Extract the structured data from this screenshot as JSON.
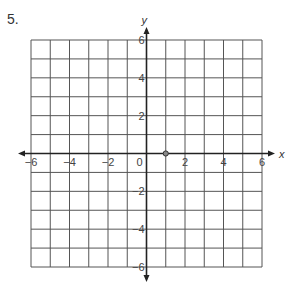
{
  "problem_number": "5.",
  "chart_data": {
    "type": "scatter",
    "title": "",
    "xlabel": "x",
    "ylabel": "y",
    "xlim": [
      -6,
      6
    ],
    "ylim": [
      -6,
      6
    ],
    "grid": true,
    "grid_step": 1,
    "x_ticks": [
      -6,
      -4,
      -2,
      0,
      2,
      4,
      6
    ],
    "y_ticks": [
      6,
      4,
      2,
      -2,
      -4,
      -6
    ],
    "x_tick_labels": [
      "−6",
      "−4",
      "−2",
      "0",
      "2",
      "4",
      "6"
    ],
    "y_tick_labels": [
      "6",
      "4",
      "2",
      "−2",
      "−4",
      "−6"
    ],
    "points": [
      {
        "x": 1,
        "y": 0
      }
    ],
    "colors": {
      "grid": "#555555",
      "axis": "#222222",
      "point_fill": "#888888",
      "point_stroke": "#333333"
    }
  }
}
